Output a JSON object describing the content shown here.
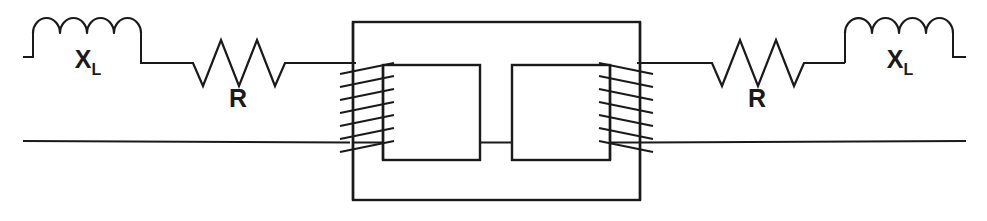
{
  "figure": {
    "kind": "circuit-diagram",
    "width": 987,
    "height": 221,
    "background_color": "#ffffff",
    "line_color": "#1a1a1a"
  },
  "labels": {
    "left_inductor": {
      "symbol": "X",
      "subscript": "L"
    },
    "left_resistor": {
      "symbol": "R",
      "subscript": ""
    },
    "right_inductor": {
      "symbol": "X",
      "subscript": "L"
    },
    "right_resistor": {
      "symbol": "R",
      "subscript": ""
    }
  },
  "components": {
    "left_branch": [
      {
        "name": "inductor",
        "label": "X_L",
        "humps": 4
      },
      {
        "name": "resistor",
        "label": "R",
        "peaks": 3
      }
    ],
    "right_branch": [
      {
        "name": "resistor",
        "label": "R",
        "peaks": 3
      },
      {
        "name": "inductor",
        "label": "X_L",
        "humps": 4
      }
    ],
    "transformer": {
      "name": "iron-core-transformer",
      "core_windows": 2,
      "primary_turns_drawn": 7,
      "secondary_turns_drawn": 7
    },
    "return_conductor": {
      "name": "bottom-wire",
      "label": ""
    }
  },
  "geometry": {
    "top_rail_y": 63,
    "bottom_rail_y": 142,
    "left_terminal_x": 23,
    "right_terminal_x": 965,
    "core_outer": {
      "x1": 353,
      "y1": 22,
      "x2": 640,
      "y2": 200
    },
    "core_window_left": {
      "x1": 383,
      "y1": 65,
      "x2": 480,
      "y2": 160
    },
    "core_window_right": {
      "x1": 512,
      "y1": 65,
      "x2": 610,
      "y2": 160
    }
  }
}
